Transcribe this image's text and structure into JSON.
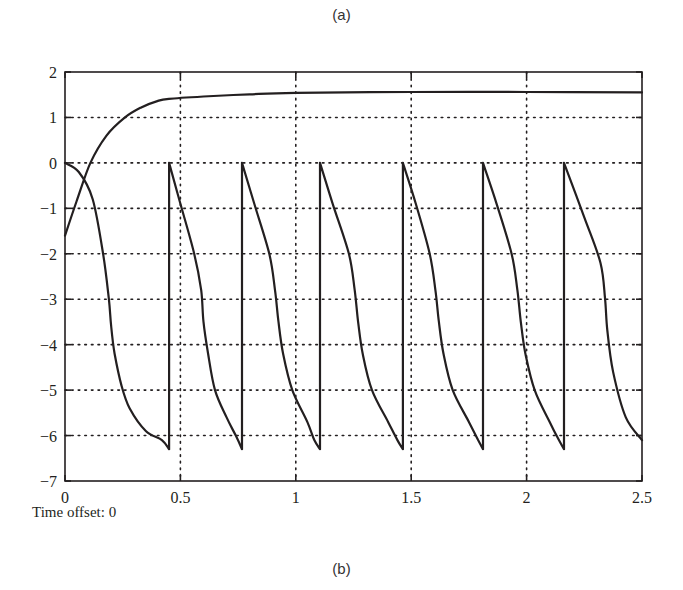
{
  "figure": {
    "top_label": "(a)",
    "bottom_label": "(b)",
    "footer_note": "Time offset: 0"
  },
  "chart_data": {
    "type": "line",
    "title": "",
    "xlabel": "",
    "ylabel": "",
    "xlim": [
      0,
      2.5
    ],
    "ylim": [
      -7,
      2
    ],
    "xticks": [
      0,
      0.5,
      1,
      1.5,
      2,
      2.5
    ],
    "xtick_labels": [
      "0",
      "0.5",
      "1",
      "1.5",
      "2",
      "2.5"
    ],
    "yticks": [
      2,
      1,
      0,
      -1,
      -2,
      -3,
      -4,
      -5,
      -6,
      -7
    ],
    "ytick_labels": [
      "2",
      "1",
      "0",
      "−1",
      "−2",
      "−3",
      "−4",
      "−5",
      "−6",
      "−7"
    ],
    "grid": "dotted",
    "legend": null,
    "series": [
      {
        "name": "saturating-signal",
        "color": "#231f20",
        "x": [
          0,
          0.05,
          0.11,
          0.18,
          0.26,
          0.33,
          0.4,
          0.45,
          0.6,
          0.8,
          1.0,
          1.5,
          2.0,
          2.5
        ],
        "y": [
          -1.6,
          -0.85,
          0.0,
          0.6,
          1.0,
          1.22,
          1.36,
          1.41,
          1.46,
          1.51,
          1.54,
          1.56,
          1.56,
          1.55
        ]
      },
      {
        "name": "sawtooth-signal",
        "color": "#231f20",
        "x": [
          0,
          0.06,
          0.12,
          0.165,
          0.19,
          0.2,
          0.215,
          0.245,
          0.28,
          0.35,
          0.42,
          0.451,
          0.451,
          0.5,
          0.56,
          0.59,
          0.6,
          0.62,
          0.65,
          0.7,
          0.74,
          0.767,
          0.767,
          0.82,
          0.885,
          0.91,
          0.925,
          0.945,
          0.985,
          1.05,
          1.08,
          1.105,
          1.105,
          1.16,
          1.23,
          1.255,
          1.27,
          1.29,
          1.33,
          1.4,
          1.44,
          1.464,
          1.464,
          1.52,
          1.58,
          1.605,
          1.62,
          1.64,
          1.68,
          1.75,
          1.79,
          1.811,
          1.811,
          1.87,
          1.935,
          1.96,
          1.975,
          1.995,
          2.035,
          2.1,
          2.14,
          2.162,
          2.162,
          2.25,
          2.32,
          2.34,
          2.35,
          2.375,
          2.43,
          2.5
        ],
        "y": [
          0,
          -0.2,
          -0.8,
          -2.0,
          -3.0,
          -3.6,
          -4.2,
          -4.9,
          -5.4,
          -5.9,
          -6.1,
          -6.3,
          0,
          -0.9,
          -2.0,
          -2.8,
          -3.5,
          -4.2,
          -5.0,
          -5.6,
          -6.0,
          -6.3,
          0,
          -0.9,
          -2.0,
          -2.8,
          -3.5,
          -4.2,
          -5.0,
          -5.7,
          -6.1,
          -6.3,
          0,
          -0.9,
          -2.0,
          -2.8,
          -3.5,
          -4.2,
          -5.0,
          -5.7,
          -6.1,
          -6.3,
          0,
          -0.9,
          -2.0,
          -2.8,
          -3.5,
          -4.2,
          -5.0,
          -5.7,
          -6.1,
          -6.3,
          0,
          -0.9,
          -2.0,
          -2.8,
          -3.5,
          -4.2,
          -5.0,
          -5.7,
          -6.1,
          -6.3,
          0,
          -1.2,
          -2.2,
          -3.0,
          -3.7,
          -4.6,
          -5.6,
          -6.1
        ]
      }
    ],
    "reset_times": [
      0.451,
      0.767,
      1.105,
      1.464,
      1.811,
      2.162
    ],
    "sawtooth_min": -6.3,
    "saturation_level": 1.55
  }
}
